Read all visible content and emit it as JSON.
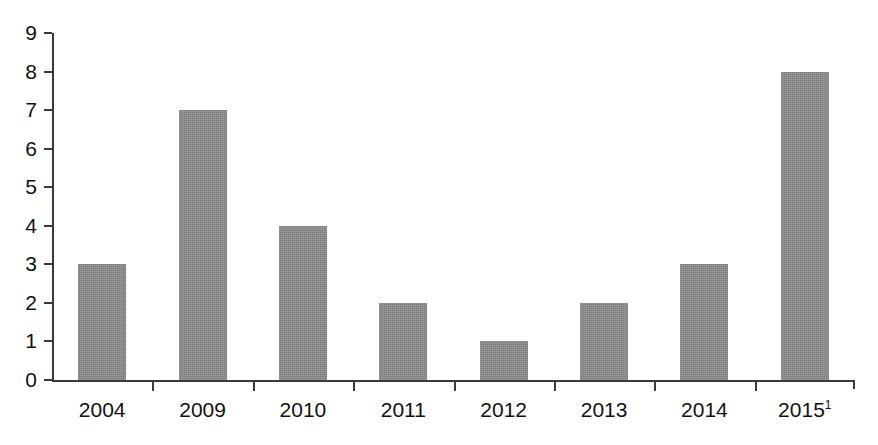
{
  "chart_data": {
    "type": "bar",
    "title": "",
    "subtitle": "",
    "xlabel": "",
    "ylabel": "",
    "categories": [
      "2004",
      "2009",
      "2010",
      "2011",
      "2012",
      "2013",
      "2014",
      "2015"
    ],
    "category_labels": [
      "2004",
      "2009",
      "2010",
      "2011",
      "2012",
      "2013",
      "2014",
      "2015"
    ],
    "category_footnotes": [
      "",
      "",
      "",
      "",
      "",
      "",
      "",
      "1"
    ],
    "values": [
      3,
      7,
      4,
      2,
      1,
      2,
      3,
      8
    ],
    "ylim": [
      0,
      9
    ],
    "ytick_labels": [
      "0",
      "1",
      "2",
      "3",
      "4",
      "5",
      "6",
      "7",
      "8",
      "9"
    ],
    "ytick_values": [
      0,
      1,
      2,
      3,
      4,
      5,
      6,
      7,
      8,
      9
    ],
    "grid": false,
    "legend": false,
    "legend_position": "none",
    "bar_color": "#8a8a8a",
    "axis_color": "#3a3a3a",
    "background_color": "#ffffff",
    "text_color": "#111111"
  }
}
